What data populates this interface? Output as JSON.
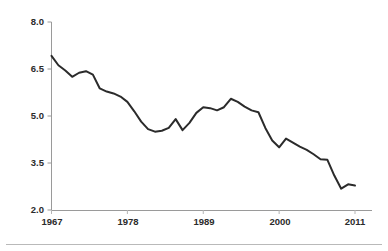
{
  "chart_data": {
    "type": "line",
    "title": "",
    "subtitle": "",
    "xlabel": "",
    "ylabel": "Copland Rent-To-Value (%)",
    "xlim": [
      1967,
      2011
    ],
    "ylim": [
      2.0,
      8.0
    ],
    "grid": false,
    "legend": "none",
    "x_tick_labels": [
      "1967",
      "1978",
      "1989",
      "2000",
      "2011"
    ],
    "x_ticks": [
      1967,
      1978,
      1989,
      2000,
      2011
    ],
    "y_tick_labels": [
      "8.0",
      "6.5",
      "5.0",
      "3.5",
      "2.0"
    ],
    "y_ticks": [
      8.0,
      6.5,
      5.0,
      3.5,
      2.0
    ],
    "line_color": "#2b2b2b",
    "line_width": 2.0,
    "series": [
      {
        "name": "Copland Rent-To-Value",
        "x": [
          1967,
          1968,
          1969,
          1970,
          1971,
          1972,
          1973,
          1974,
          1975,
          1976,
          1977,
          1978,
          1979,
          1980,
          1981,
          1982,
          1983,
          1984,
          1985,
          1986,
          1987,
          1988,
          1989,
          1990,
          1991,
          1992,
          1993,
          1994,
          1995,
          1996,
          1997,
          1998,
          1999,
          2000,
          2001,
          2002,
          2003,
          2004,
          2005,
          2006,
          2007,
          2008,
          2009,
          2010,
          2011
        ],
        "values": [
          6.92,
          6.62,
          6.45,
          6.25,
          6.38,
          6.43,
          6.32,
          5.88,
          5.78,
          5.72,
          5.62,
          5.45,
          5.15,
          4.82,
          4.58,
          4.5,
          4.53,
          4.62,
          4.9,
          4.55,
          4.78,
          5.1,
          5.28,
          5.25,
          5.18,
          5.28,
          5.55,
          5.45,
          5.3,
          5.18,
          5.12,
          4.62,
          4.22,
          4.0,
          4.28,
          4.15,
          4.02,
          3.92,
          3.78,
          3.62,
          3.6,
          3.1,
          2.68,
          2.82,
          2.78
        ]
      }
    ]
  },
  "axes": {
    "ylabel": "Copland Rent-To-Value (%)"
  }
}
